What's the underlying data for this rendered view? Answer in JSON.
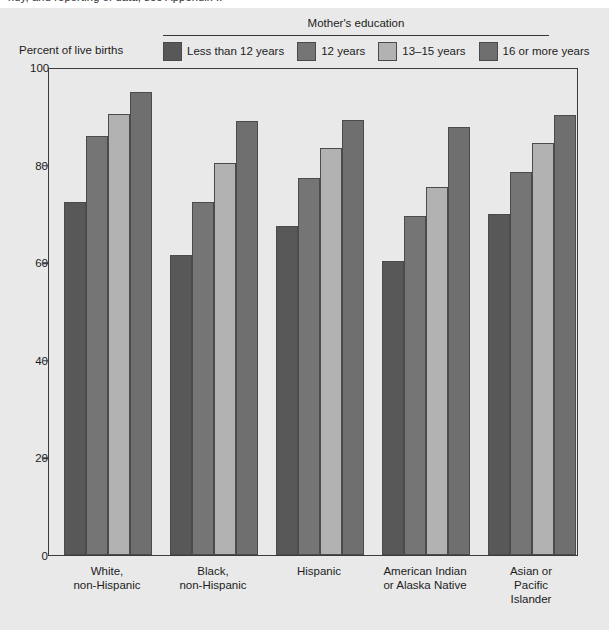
{
  "top_cut_text": "ndy, and reporting of data, see Appendix I.",
  "legend": {
    "title": "Mother's education",
    "items": [
      {
        "label": "Less than 12 years",
        "color": "#585858"
      },
      {
        "label": "12 years",
        "color": "#757575"
      },
      {
        "label": "13–15 years",
        "color": "#b2b2b2"
      },
      {
        "label": "16 or more years",
        "color": "#6f6f6f"
      }
    ]
  },
  "axis": {
    "y_title": "Percent of live births",
    "y_ticks": [
      "0",
      "20",
      "40",
      "60",
      "80",
      "100"
    ],
    "y_min": 0,
    "y_max": 100
  },
  "chart_data": {
    "type": "bar",
    "title": "",
    "xlabel": "",
    "ylabel": "Percent of live births",
    "ylim": [
      0,
      100
    ],
    "yticks": [
      0,
      20,
      40,
      60,
      80,
      100
    ],
    "grid": false,
    "legend_title": "Mother's education",
    "legend_position": "top",
    "categories": [
      "White,\nnon-Hispanic",
      "Black,\nnon-Hispanic",
      "Hispanic",
      "American Indian\nor Alaska Native",
      "Asian or Pacific\nIslander"
    ],
    "series": [
      {
        "name": "Less than 12 years",
        "color": "#585858",
        "values": [
          72.3,
          61.5,
          67.4,
          60.2,
          69.9
        ]
      },
      {
        "name": "12 years",
        "color": "#757575",
        "values": [
          85.9,
          72.3,
          77.3,
          69.4,
          78.4
        ]
      },
      {
        "name": "13–15 years",
        "color": "#b2b2b2",
        "values": [
          90.4,
          80.3,
          83.5,
          75.4,
          84.5
        ]
      },
      {
        "name": "16 or more years",
        "color": "#6f6f6f",
        "values": [
          94.8,
          88.9,
          89.1,
          87.8,
          90.2
        ]
      }
    ]
  }
}
